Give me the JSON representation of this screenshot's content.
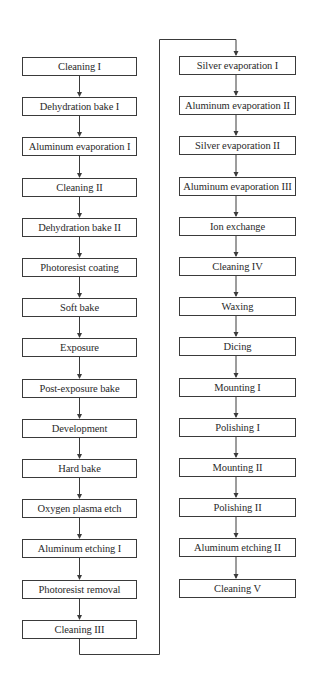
{
  "diagram": {
    "type": "process-flow",
    "colors": {
      "line": "#3a3a3a",
      "text": "#2a2a2a",
      "background": "#ffffff"
    },
    "left_column": [
      "Cleaning I",
      "Dehydration bake I",
      "Aluminum evaporation I",
      "Cleaning II",
      "Dehydration bake II",
      "Photoresist coating",
      "Soft bake",
      "Exposure",
      "Post-exposure bake",
      "Development",
      "Hard bake",
      "Oxygen plasma etch",
      "Aluminum etching I",
      "Photoresist removal",
      "Cleaning III"
    ],
    "right_column": [
      "Silver evaporation I",
      "Aluminum evaporation II",
      "Silver evaporation II",
      "Aluminum evaporation III",
      "Ion exchange",
      "Cleaning IV",
      "Waxing",
      "Dicing",
      "Mounting I",
      "Polishing I",
      "Mounting II",
      "Polishing II",
      "Aluminum etching II",
      "Cleaning V"
    ],
    "connector": {
      "from": "Cleaning III",
      "to": "Silver evaporation I"
    }
  }
}
